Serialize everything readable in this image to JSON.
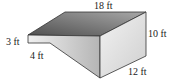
{
  "figure": {
    "type": "3d-prism-diagram",
    "labels": {
      "top_length": "18 ft",
      "height_right": "10 ft",
      "height_left": "3 ft",
      "step_length": "4 ft",
      "depth": "12 ft"
    },
    "colors": {
      "top_face_dark": "#5a5a5a",
      "top_face_light": "#a0a0a0",
      "front_face_light": "#e8e8e8",
      "front_face_dark": "#b8b8b8",
      "right_face": "#d8d8d8",
      "edge": "#333333"
    }
  }
}
